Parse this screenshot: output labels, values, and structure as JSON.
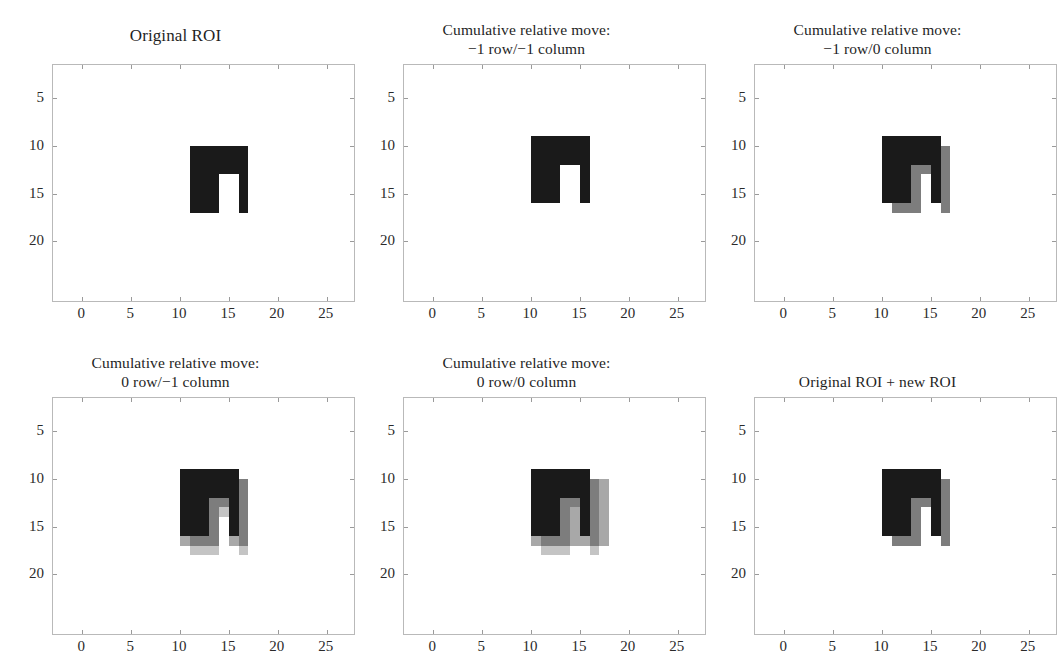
{
  "figure": {
    "width": 1053,
    "height": 666,
    "background": "#ffffff",
    "rows": 2,
    "cols": 3
  },
  "axes_config": {
    "xticks": [
      0,
      5,
      10,
      15,
      20,
      25
    ],
    "xtick_labels": [
      "0",
      "5",
      "10",
      "15",
      "20",
      "25"
    ],
    "yticks": [
      5,
      10,
      15,
      20
    ],
    "ytick_labels": [
      "5",
      "10",
      "15",
      "20"
    ],
    "xlim": [
      -3,
      28
    ],
    "ylim": [
      26.5,
      1.5
    ],
    "grid": false,
    "frame_color": "#b9b9b9",
    "tick_color": "#9a9a9a"
  },
  "colors": {
    "black": "#1a1a1a",
    "dark_gray": "#404040",
    "mid_gray": "#7d7d7d",
    "light_gray": "#a8a8a8",
    "pale_gray": "#c4c4c4",
    "background": "#ffffff"
  },
  "roi_shape": {
    "description": "arch / inverted-U mask",
    "outer": {
      "col0": 11,
      "col1": 17,
      "row0": 10,
      "row1": 17
    },
    "notch": {
      "col0": 14,
      "col1": 16,
      "row0": 13,
      "row1": 17
    }
  },
  "panels": [
    {
      "id": "panel-original-roi",
      "title_line1": "Original ROI",
      "title_line2": "",
      "layers": [
        {
          "name": "original-roi",
          "color": "#1a1a1a",
          "dcol": 0,
          "drow": 0
        }
      ]
    },
    {
      "id": "panel-move-m1row-m1col",
      "title_line1": "Cumulative relative move:",
      "title_line2": "−1 row/−1 column",
      "layers": [
        {
          "name": "moved-roi",
          "color": "#1a1a1a",
          "dcol": -1,
          "drow": -1
        }
      ]
    },
    {
      "id": "panel-move-m1row-0col",
      "title_line1": "Cumulative relative move:",
      "title_line2": "−1 row/0 column",
      "layers": [
        {
          "name": "previous-roi",
          "color": "#7d7d7d",
          "dcol": 0,
          "drow": 0
        },
        {
          "name": "moved-roi",
          "color": "#1a1a1a",
          "dcol": -1,
          "drow": -1
        }
      ]
    },
    {
      "id": "panel-move-0row-m1col",
      "title_line1": "Cumulative relative move:",
      "title_line2": "0 row/−1 column",
      "layers": [
        {
          "name": "roi-trace-3",
          "color": "#c4c4c4",
          "dcol": 0,
          "drow": 1
        },
        {
          "name": "roi-trace-2",
          "color": "#a8a8a8",
          "dcol": -1,
          "drow": 0
        },
        {
          "name": "roi-trace-1",
          "color": "#7d7d7d",
          "dcol": 0,
          "drow": 0
        },
        {
          "name": "moved-roi",
          "color": "#1a1a1a",
          "dcol": -1,
          "drow": -1
        }
      ]
    },
    {
      "id": "panel-move-0row-0col",
      "title_line1": "Cumulative relative move:",
      "title_line2": "0 row/0 column",
      "layers": [
        {
          "name": "roi-trace-4",
          "color": "#c4c4c4",
          "dcol": 0,
          "drow": 1
        },
        {
          "name": "roi-trace-3",
          "color": "#a8a8a8",
          "dcol": 1,
          "drow": 0
        },
        {
          "name": "roi-trace-2",
          "color": "#a8a8a8",
          "dcol": -1,
          "drow": 0
        },
        {
          "name": "roi-trace-1",
          "color": "#7d7d7d",
          "dcol": 0,
          "drow": 0
        },
        {
          "name": "moved-roi",
          "color": "#1a1a1a",
          "dcol": -1,
          "drow": -1
        }
      ]
    },
    {
      "id": "panel-original-plus-new-roi",
      "title_line1": "Original ROI + new ROI",
      "title_line2": "",
      "layers": [
        {
          "name": "new-roi",
          "color": "#7d7d7d",
          "dcol": 0,
          "drow": 0
        },
        {
          "name": "original-roi",
          "color": "#1a1a1a",
          "dcol": -1,
          "drow": -1
        }
      ]
    }
  ],
  "chart_data": {
    "type": "heatmap",
    "subplot_titles": [
      "Original ROI",
      "Cumulative relative move:\n−1 row/−1 column",
      "Cumulative relative move:\n−1 row/0 column",
      "Cumulative relative move:\n0 row/−1 column",
      "Cumulative relative move:\n0 row/0 column",
      "Original ROI + new ROI"
    ],
    "xlabel": "",
    "ylabel": "",
    "xlim": [
      -3,
      28
    ],
    "ylim": [
      26.5,
      1.5
    ],
    "xticks": [
      0,
      5,
      10,
      15,
      20,
      25
    ],
    "yticks": [
      5,
      10,
      15,
      20
    ],
    "grid": false,
    "legend": "none",
    "mask_geometry": {
      "outer_columns": [
        11,
        17
      ],
      "outer_rows": [
        10,
        17
      ],
      "notch_columns": [
        14,
        16
      ],
      "notch_rows": [
        13,
        17
      ]
    },
    "offsets_per_panel": [
      {
        "panel": 1,
        "row": 0,
        "column": 0
      },
      {
        "panel": 2,
        "row": -1,
        "column": -1
      },
      {
        "panel": 3,
        "row": -1,
        "column": 0
      },
      {
        "panel": 4,
        "row": 0,
        "column": -1
      },
      {
        "panel": 5,
        "row": 0,
        "column": 0
      },
      {
        "panel": 6,
        "row": 0,
        "column": 0
      }
    ]
  }
}
